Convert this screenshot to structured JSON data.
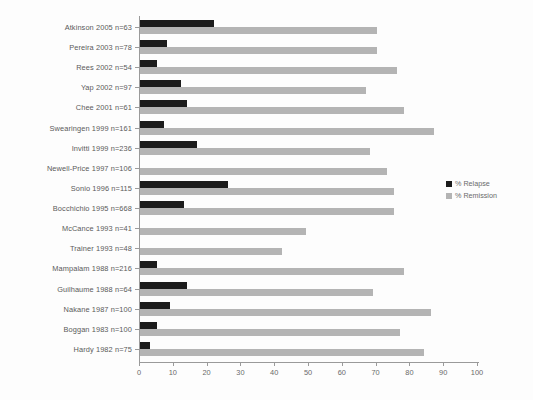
{
  "chart_data": {
    "type": "bar",
    "orientation": "horizontal",
    "title": "",
    "xlabel": "",
    "ylabel": "",
    "xlim": [
      0,
      100
    ],
    "xticks": [
      0,
      10,
      20,
      30,
      40,
      50,
      60,
      70,
      80,
      90,
      100
    ],
    "grid": false,
    "legend_position": "right",
    "categories": [
      "Atkinson 2005 n=63",
      "Pereira 2003  n=78",
      "Rees  2002  n=54",
      "Yap 2002  n=97",
      "Chee 2001  n=61",
      "Swearingen 1999  n=161",
      "Invitti 1999  n=236",
      "Newell-Price 1997  n=106",
      "Sonio 1996  n=115",
      "Bocchichio 1995  n=668",
      "McCance 1993  n=41",
      "Trainer 1993 n=48",
      "Mampalam 1988  n=216",
      "Guilhaume 1988  n=64",
      "Nakane 1987  n=100",
      "Boggan 1983  n=100",
      "Hardy 1982  n=75"
    ],
    "series": [
      {
        "name": "% Relapse",
        "color": "#1b1b1b",
        "values": [
          22,
          8,
          5,
          12,
          14,
          7,
          17,
          0,
          26,
          13,
          0,
          0,
          5,
          14,
          9,
          5,
          3
        ]
      },
      {
        "name": "% Remission",
        "color": "#b4b4b4",
        "values": [
          70,
          70,
          76,
          67,
          78,
          87,
          68,
          73,
          75,
          75,
          49,
          42,
          78,
          69,
          86,
          77,
          84
        ]
      }
    ]
  },
  "legend": {
    "items": [
      {
        "label": "% Relapse",
        "color": "#1b1b1b"
      },
      {
        "label": "% Remission",
        "color": "#b4b4b4"
      }
    ]
  },
  "axis": {
    "x_tick_labels": [
      "0",
      "10",
      "20",
      "30",
      "40",
      "50",
      "60",
      "70",
      "80",
      "90",
      "100"
    ]
  }
}
